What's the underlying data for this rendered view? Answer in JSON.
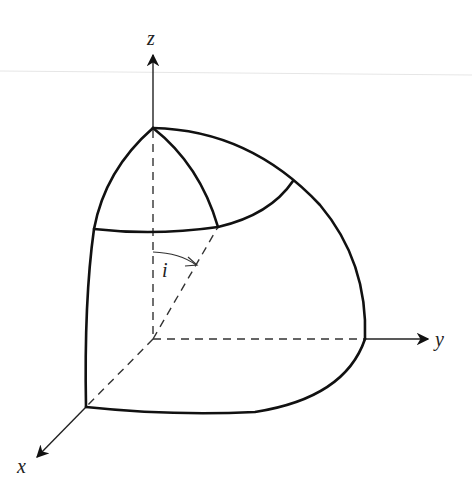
{
  "figure": {
    "type": "3d-geometry-diagram",
    "axes": {
      "x": {
        "label": "x"
      },
      "y": {
        "label": "y"
      },
      "z": {
        "label": "z"
      }
    },
    "angle": {
      "label": "i"
    },
    "colors": {
      "stroke": "#111111",
      "dashed": "#333333",
      "background": "#ffffff"
    }
  }
}
